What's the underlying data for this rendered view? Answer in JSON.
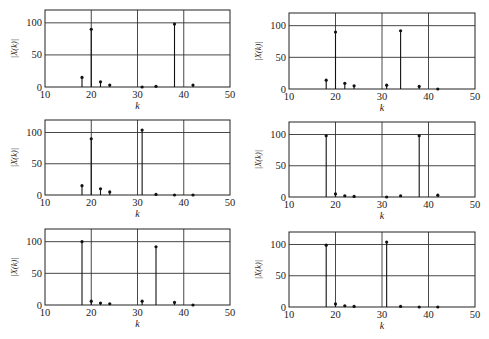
{
  "chart_data": [
    {
      "type": "stem",
      "title": "",
      "xlabel": "k",
      "ylabel": "|X(k)|",
      "xlim": [
        10,
        50
      ],
      "ylim": [
        0,
        120
      ],
      "xticks": [
        10,
        20,
        30,
        40,
        50
      ],
      "yticks": [
        0,
        50,
        100
      ],
      "grid": true,
      "x": [
        18,
        20,
        22,
        24,
        31,
        34,
        38,
        42
      ],
      "values": [
        15,
        90,
        8,
        3,
        0,
        1,
        98,
        3
      ]
    },
    {
      "type": "stem",
      "title": "",
      "xlabel": "k",
      "ylabel": "|X(k)|",
      "xlim": [
        10,
        50
      ],
      "ylim": [
        0,
        120
      ],
      "xticks": [
        10,
        20,
        30,
        40,
        50
      ],
      "yticks": [
        0,
        50,
        100
      ],
      "grid": true,
      "x": [
        18,
        20,
        22,
        24,
        31,
        34,
        38,
        42
      ],
      "values": [
        14,
        90,
        9,
        5,
        6,
        92,
        4,
        0
      ]
    },
    {
      "type": "stem",
      "title": "",
      "xlabel": "k",
      "ylabel": "|X(k)|",
      "xlim": [
        10,
        50
      ],
      "ylim": [
        0,
        120
      ],
      "xticks": [
        10,
        20,
        30,
        40,
        50
      ],
      "yticks": [
        0,
        50,
        100
      ],
      "grid": true,
      "x": [
        18,
        20,
        22,
        24,
        31,
        34,
        38,
        42
      ],
      "values": [
        15,
        90,
        10,
        5,
        104,
        1,
        0,
        0
      ]
    },
    {
      "type": "stem",
      "title": "",
      "xlabel": "k",
      "ylabel": "|X(k)|",
      "xlim": [
        10,
        50
      ],
      "ylim": [
        0,
        120
      ],
      "xticks": [
        10,
        20,
        30,
        40,
        50
      ],
      "yticks": [
        0,
        50,
        100
      ],
      "grid": true,
      "x": [
        18,
        20,
        22,
        24,
        31,
        34,
        38,
        42
      ],
      "values": [
        98,
        5,
        2,
        1,
        0,
        2,
        98,
        3
      ]
    },
    {
      "type": "stem",
      "title": "",
      "xlabel": "k",
      "ylabel": "|X(k)|",
      "xlim": [
        10,
        50
      ],
      "ylim": [
        0,
        120
      ],
      "xticks": [
        10,
        20,
        30,
        40,
        50
      ],
      "yticks": [
        0,
        50,
        100
      ],
      "grid": true,
      "x": [
        18,
        20,
        22,
        24,
        31,
        34,
        38,
        42
      ],
      "values": [
        100,
        6,
        3,
        2,
        6,
        92,
        4,
        0
      ]
    },
    {
      "type": "stem",
      "title": "",
      "xlabel": "k",
      "ylabel": "|X(k)|",
      "xlim": [
        10,
        50
      ],
      "ylim": [
        0,
        120
      ],
      "xticks": [
        10,
        20,
        30,
        40,
        50
      ],
      "yticks": [
        0,
        50,
        100
      ],
      "grid": true,
      "x": [
        18,
        20,
        22,
        24,
        31,
        34,
        38,
        42
      ],
      "values": [
        99,
        5,
        2,
        1,
        104,
        1,
        0,
        0
      ]
    }
  ]
}
